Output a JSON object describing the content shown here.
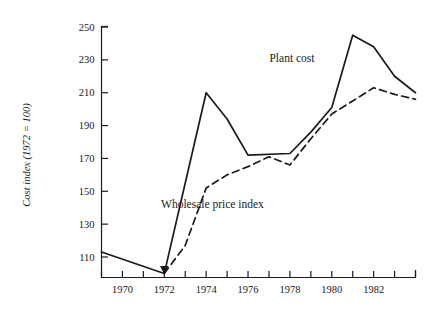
{
  "chart_data": {
    "type": "line",
    "title": "",
    "xlabel": "",
    "ylabel": "Cost index (1972 = 100)",
    "xlim": [
      1969,
      1984
    ],
    "ylim": [
      100,
      256
    ],
    "grid": false,
    "legend": "inline-annotations",
    "x_ticks": [
      1969,
      1970,
      1971,
      1972,
      1973,
      1974,
      1975,
      1976,
      1977,
      1978,
      1979,
      1980,
      1981,
      1982,
      1983,
      1984
    ],
    "x_tick_labels": [
      "",
      "1970",
      "",
      "1972",
      "",
      "1974",
      "",
      "1976",
      "",
      "1978",
      "",
      "1980",
      "",
      "1982",
      "",
      ""
    ],
    "y_ticks": [
      110,
      130,
      150,
      170,
      190,
      210,
      230,
      250
    ],
    "y_tick_labels": [
      "110",
      "130",
      "150",
      "170",
      "190",
      "210",
      "230",
      "250"
    ],
    "series": [
      {
        "name": "Plant cost",
        "style": "solid",
        "color": "#1a1a1a",
        "x": [
          1969,
          1972,
          1974,
          1975,
          1976,
          1978,
          1979,
          1980,
          1981,
          1982,
          1983,
          1984
        ],
        "values": [
          113,
          100,
          210,
          194,
          172,
          173,
          186,
          201,
          245,
          238,
          220,
          210
        ],
        "label_x": 1978.1,
        "label_y": 229
      },
      {
        "name": "Wholesale price index",
        "style": "dashed",
        "color": "#1a1a1a",
        "x": [
          1972,
          1973,
          1974,
          1975,
          1976,
          1977,
          1978,
          1979,
          1980,
          1981,
          1982,
          1983,
          1984
        ],
        "values": [
          100,
          117,
          152,
          160,
          165,
          171,
          166,
          182,
          197,
          205,
          213,
          209,
          206
        ],
        "label_x": 1974.3,
        "label_y": 140
      }
    ]
  },
  "axis": {
    "y_axis_title": "Cost index (1972 = 100)"
  },
  "annotations": {
    "plant_cost": "Plant cost",
    "wholesale_price_index": "Wholesale price index"
  }
}
